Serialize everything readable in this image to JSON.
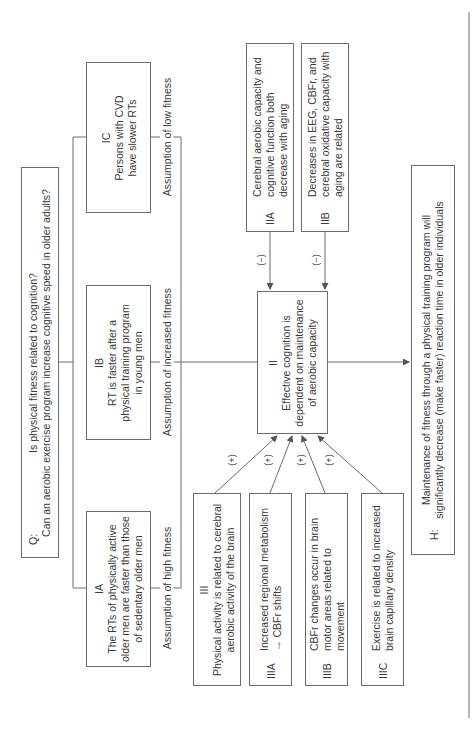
{
  "question": {
    "label": "Q:",
    "line1": "Is physical fitness related to cognition?",
    "line2": "Can an aerobic exercise program increase cognitive speed in older adults?"
  },
  "level1": [
    {
      "id": "IC",
      "text": "Persons with CVD have slower RTs",
      "assumption": "Assumption of low fitness"
    },
    {
      "id": "IB",
      "text": "RT is faster after a physical training program in young men",
      "assumption": "Assumption of increased fitness"
    },
    {
      "id": "IA",
      "text": "The RTs of physically active older men are faster than those of sedentary older men",
      "assumption": "Assumption of high fitness"
    }
  ],
  "level2_negative": [
    {
      "id": "IIA",
      "text": "Cerebral aerobic capacity and cognitive function both decrease with aging",
      "sign": "(−)"
    },
    {
      "id": "IIB",
      "text": "Decreases in EEG, CBFr, and cerebral oxidative capacity with aging are related",
      "sign": "(−)"
    }
  ],
  "central": {
    "id": "II",
    "text": "Effective cognition is dependent on maintenance of aerobic capacity"
  },
  "level3_positive": [
    {
      "id": "III",
      "text": "Physical activity is related to cerebral aerobic activity of the brain",
      "sign": "(+)"
    },
    {
      "id": "IIIA",
      "text": "Increased regional metabolism → CBFr shifts",
      "sign": "(+)"
    },
    {
      "id": "IIIB",
      "text": "CBFr changes occur in brain motor areas related to movement",
      "sign": "(+)"
    },
    {
      "id": "IIIC",
      "text": "Exercise is related to increased brain capillary density",
      "sign": "(+)"
    }
  ],
  "hypothesis": {
    "label": "H:",
    "line1": "Maintenance of fitness through a physical training program will",
    "line2": "significantly decrease (make faster) reaction time in older individuals"
  },
  "colors": {
    "line": "#6b6b6b",
    "text": "#3a3a3a",
    "background": "#ffffff"
  }
}
